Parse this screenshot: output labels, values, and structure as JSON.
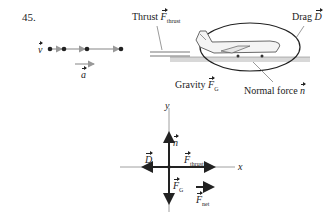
{
  "problem_number": "45.",
  "motion_diagram": {
    "velocity_label": "v",
    "acceleration_label": "a"
  },
  "scene": {
    "thrust_label": "Thrust",
    "thrust_symbol": "F",
    "thrust_sub": "thrust",
    "drag_label": "Drag",
    "drag_symbol": "D",
    "gravity_label": "Gravity",
    "gravity_symbol": "F",
    "gravity_sub": "G",
    "normal_label": "Normal force",
    "normal_symbol": "n"
  },
  "free_body_diagram": {
    "y_axis": "y",
    "x_axis": "x",
    "normal": "n",
    "drag": "D",
    "thrust_symbol": "F",
    "thrust_sub": "thrust",
    "gravity_symbol": "F",
    "gravity_sub": "G",
    "net_symbol": "F",
    "net_sub": "net"
  },
  "colors": {
    "ink": "#222222",
    "gray": "#999999",
    "ground": "#cccccc"
  }
}
